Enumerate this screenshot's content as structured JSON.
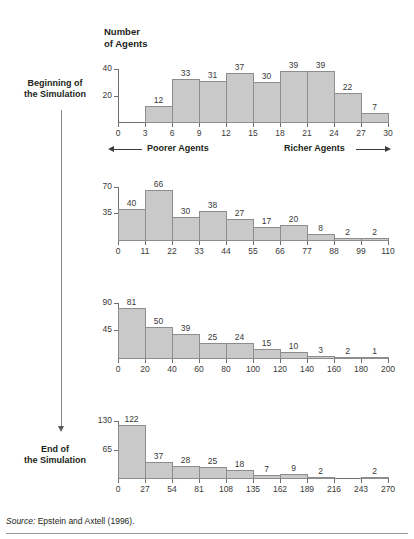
{
  "figure": {
    "axis_title": "Number\nof Agents",
    "stage_labels": {
      "start": "Beginning of\nthe Simulation",
      "end": "End of\nthe Simulation"
    },
    "band": {
      "poorer": "Poorer Agents",
      "richer": "Richer Agents"
    },
    "source": {
      "prefix": "Source:",
      "text": "Epstein and Axtell (1996)."
    },
    "colors": {
      "bar_fill": "#c9c9c9",
      "bar_stroke": "#8d8d8d",
      "axis": "#6d6d6d",
      "text": "#231f20"
    }
  },
  "chart_data": [
    {
      "id": "panel-1",
      "type": "bar",
      "title": "Number of Agents",
      "xlabel": "",
      "ylabel": "Number of Agents",
      "ticks_x": [
        0,
        3,
        6,
        9,
        12,
        15,
        18,
        21,
        24,
        27,
        30
      ],
      "ticks_y": [
        20,
        40
      ],
      "ylim": [
        0,
        44
      ],
      "xlim": [
        0,
        30
      ],
      "bin_width": 3,
      "bin_starts": [
        3,
        6,
        9,
        12,
        15,
        18,
        21,
        24,
        27
      ],
      "values": [
        12,
        33,
        31,
        37,
        30,
        39,
        39,
        22,
        7
      ],
      "grid": false,
      "legend": "none"
    },
    {
      "id": "panel-2",
      "type": "bar",
      "title": "",
      "xlabel": "",
      "ylabel": "",
      "ticks_x": [
        0,
        11,
        22,
        33,
        44,
        55,
        66,
        77,
        88,
        99,
        110
      ],
      "ticks_y": [
        35,
        70
      ],
      "ylim": [
        0,
        76
      ],
      "xlim": [
        0,
        110
      ],
      "bin_width": 11,
      "bin_starts": [
        0,
        11,
        22,
        33,
        44,
        55,
        66,
        77,
        88,
        99
      ],
      "values": [
        40,
        66,
        30,
        38,
        27,
        17,
        20,
        8,
        2,
        2
      ],
      "grid": false,
      "legend": "none"
    },
    {
      "id": "panel-3",
      "type": "bar",
      "title": "",
      "xlabel": "",
      "ylabel": "",
      "ticks_x": [
        0,
        20,
        40,
        60,
        80,
        100,
        120,
        140,
        160,
        180,
        200
      ],
      "ticks_y": [
        45,
        90
      ],
      "ylim": [
        0,
        98
      ],
      "xlim": [
        0,
        200
      ],
      "bin_width": 20,
      "bin_starts": [
        0,
        20,
        40,
        60,
        80,
        100,
        120,
        140,
        160,
        180
      ],
      "values": [
        81,
        50,
        39,
        25,
        24,
        15,
        10,
        3,
        2,
        1
      ],
      "grid": false,
      "legend": "none"
    },
    {
      "id": "panel-4",
      "type": "bar",
      "title": "",
      "xlabel": "",
      "ylabel": "",
      "ticks_x": [
        0,
        27,
        54,
        81,
        108,
        135,
        162,
        189,
        216,
        243,
        270
      ],
      "ticks_y": [
        65,
        130
      ],
      "ylim": [
        0,
        142
      ],
      "xlim": [
        0,
        270
      ],
      "bin_width": 27,
      "bin_starts": [
        0,
        27,
        54,
        81,
        108,
        135,
        162,
        189,
        216,
        243
      ],
      "values": [
        122,
        37,
        28,
        25,
        18,
        7,
        9,
        2,
        0,
        2
      ],
      "grid": false,
      "legend": "none"
    }
  ]
}
